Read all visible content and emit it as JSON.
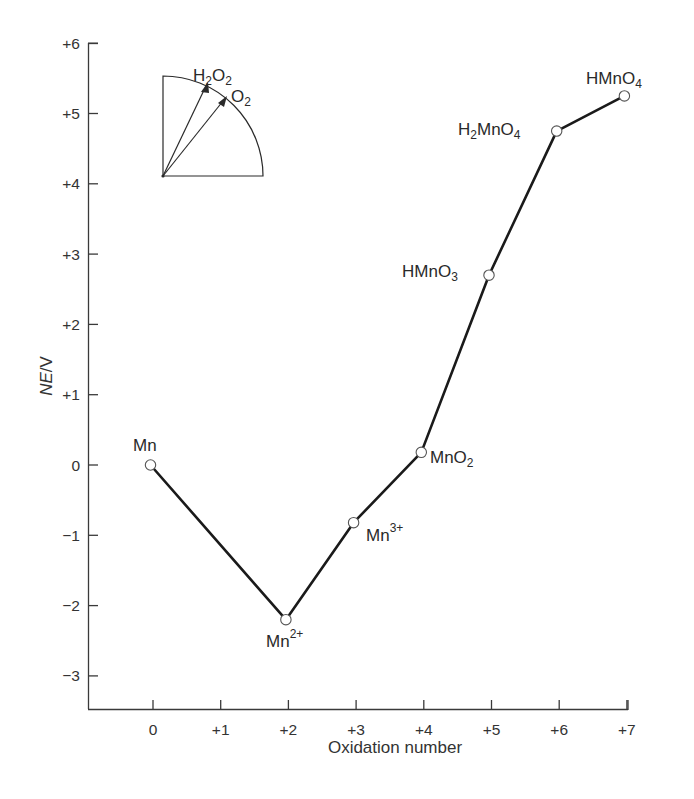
{
  "chart_data": {
    "type": "line",
    "title": "",
    "xlabel": "Oxidation number",
    "ylabel": "NE/V",
    "ylabel_parts": {
      "italic": "NE",
      "rest": "/V"
    },
    "xlim": [
      -0.95,
      7
    ],
    "ylim": [
      -3.5,
      6
    ],
    "grid": false,
    "legend": null,
    "x_ticks": [
      0,
      1,
      2,
      3,
      4,
      5,
      6,
      7
    ],
    "x_tick_labels": [
      "0",
      "+1",
      "+2",
      "+3",
      "+4",
      "+5",
      "+6",
      "+7"
    ],
    "y_ticks": [
      6,
      5,
      4,
      3,
      2,
      1,
      0,
      -1,
      -2,
      -3
    ],
    "y_tick_labels": [
      "+6",
      "+5",
      "+4",
      "+3",
      "+2",
      "+1",
      "0",
      "−1",
      "−2",
      "−3"
    ],
    "series": [
      {
        "name": "Manganese Frost diagram",
        "marker": "open-circle",
        "points": [
          {
            "label": "Mn",
            "base": "Mn",
            "sup": "",
            "x": 0,
            "y": 0.0
          },
          {
            "label": "Mn2+",
            "base": "Mn",
            "sup": "2+",
            "x": 2,
            "y": -2.2
          },
          {
            "label": "Mn3+",
            "base": "Mn",
            "sup": "3+",
            "x": 3,
            "y": -0.82
          },
          {
            "label": "MnO2",
            "base": "MnO",
            "sub": "2",
            "x": 4,
            "y": 0.18
          },
          {
            "label": "HMnO3",
            "base": "HMnO",
            "sub": "3",
            "x": 5,
            "y": 2.7
          },
          {
            "label": "H2MnO4",
            "x": 6,
            "y": 4.75
          },
          {
            "label": "HMnO4",
            "base": "HMnO",
            "sub": "4",
            "x": 7,
            "y": 5.25
          }
        ]
      }
    ],
    "annotations": [
      {
        "type": "inset-quadrant",
        "description": "Quarter-circle inset with two arrows from origin",
        "arrows": [
          {
            "label": "H2O2",
            "base1": "H",
            "sub1": "2",
            "base2": "O",
            "sub2": "2"
          },
          {
            "label": "O2",
            "base": "O",
            "sub": "2"
          }
        ]
      }
    ]
  }
}
